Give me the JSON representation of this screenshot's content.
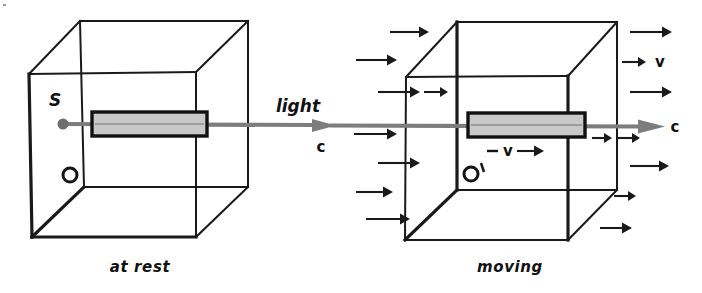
{
  "figure": {
    "type": "physics-diagram"
  },
  "panels": [
    {
      "id": "at-rest",
      "caption": "at rest",
      "caption_pos": {
        "x": 140,
        "y": 272
      },
      "cube": {
        "front_top_left": {
          "x": 29,
          "y": 74
        },
        "front_top_right": {
          "x": 196,
          "y": 72
        },
        "front_bottom_left": {
          "x": 32,
          "y": 237
        },
        "front_bottom_right": {
          "x": 196,
          "y": 237
        },
        "back_top_left": {
          "x": 80,
          "y": 21
        },
        "back_top_right": {
          "x": 248,
          "y": 21
        },
        "back_bottom_left": {
          "x": 84,
          "y": 187
        },
        "back_bottom_right": {
          "x": 248,
          "y": 187
        }
      },
      "labels": [
        {
          "name": "source-label",
          "text": "S",
          "x": 55,
          "y": 106
        },
        {
          "name": "observer-label",
          "text": "O",
          "x": 62,
          "y": 182
        }
      ],
      "observer_circle": {
        "x": 70,
        "y": 175,
        "r": 7
      },
      "source_dot": {
        "x": 63,
        "y": 124,
        "r": 5.5
      },
      "slab": {
        "x": 92,
        "y": 112,
        "width": 115,
        "height": 24
      }
    },
    {
      "id": "moving",
      "caption": "moving",
      "caption_pos": {
        "x": 510,
        "y": 272
      },
      "cube": {
        "front_top_left": {
          "x": 406,
          "y": 77
        },
        "front_top_right": {
          "x": 568,
          "y": 76
        },
        "front_bottom_left": {
          "x": 405,
          "y": 240
        },
        "front_bottom_right": {
          "x": 568,
          "y": 240
        },
        "back_top_left": {
          "x": 457,
          "y": 22
        },
        "back_top_right": {
          "x": 617,
          "y": 22
        },
        "back_bottom_left": {
          "x": 457,
          "y": 190
        },
        "back_bottom_right": {
          "x": 617,
          "y": 190
        }
      },
      "labels": [
        {
          "name": "observer-prime-label",
          "text": "O′",
          "x": 463,
          "y": 182
        },
        {
          "name": "velocity-inner-label",
          "text": "v",
          "x": 508,
          "y": 154
        }
      ],
      "observer_circle": {
        "x": 471,
        "y": 174,
        "r": 7
      },
      "slab": {
        "x": 468,
        "y": 113,
        "width": 117,
        "height": 24
      },
      "inner_velocity_arrow": {
        "dash": {
          "x1": 487,
          "y1": 151,
          "x2": 498,
          "y2": 151
        },
        "arrow": {
          "x1": 517,
          "y1": 151,
          "x2": 538,
          "y2": 151
        }
      }
    }
  ],
  "light_beam": {
    "name": "light-beam",
    "start": {
      "x": 63,
      "y": 124
    },
    "end": {
      "x": 665,
      "y": 126
    },
    "mid_arrow": {
      "x": 320,
      "y": 125
    },
    "labels": [
      {
        "name": "light-label",
        "text": "light",
        "x": 298,
        "y": 110
      },
      {
        "name": "speed-c-left-label",
        "text": "c",
        "x": 320,
        "y": 148
      },
      {
        "name": "speed-c-right-label",
        "text": "c",
        "x": 672,
        "y": 132
      }
    ]
  },
  "aether_wind": {
    "name": "aether-wind-arrows",
    "velocity_label": {
      "name": "velocity-label",
      "text": "v",
      "x": 660,
      "y": 67
    },
    "left_arrows": [
      {
        "x1": 390,
        "y1": 32,
        "x2": 427,
        "y2": 32
      },
      {
        "x1": 356,
        "y1": 60,
        "x2": 396,
        "y2": 60
      },
      {
        "x1": 378,
        "y1": 92,
        "x2": 419,
        "y2": 92
      },
      {
        "x1": 354,
        "y1": 134,
        "x2": 396,
        "y2": 134
      },
      {
        "x1": 378,
        "y1": 163,
        "x2": 419,
        "y2": 163
      },
      {
        "x1": 356,
        "y1": 192,
        "x2": 392,
        "y2": 192
      },
      {
        "x1": 366,
        "y1": 219,
        "x2": 409,
        "y2": 219
      }
    ],
    "right_arrows": [
      {
        "x1": 630,
        "y1": 32,
        "x2": 671,
        "y2": 32
      },
      {
        "x1": 622,
        "y1": 62,
        "x2": 645,
        "y2": 62
      },
      {
        "x1": 630,
        "y1": 92,
        "x2": 671,
        "y2": 92
      },
      {
        "x1": 618,
        "y1": 138,
        "x2": 637,
        "y2": 138
      },
      {
        "x1": 630,
        "y1": 166,
        "x2": 668,
        "y2": 166
      },
      {
        "x1": 618,
        "y1": 196,
        "x2": 630,
        "y2": 196
      },
      {
        "x1": 600,
        "y1": 228,
        "x2": 624,
        "y2": 228
      }
    ],
    "interior_arrows": [
      {
        "x1": 592,
        "y1": 138,
        "x2": 610,
        "y2": 138
      }
    ]
  },
  "colors": {
    "ink": "#1a1a1a",
    "beam": "#7d7d7d",
    "slab_fill": "#c9c9c9",
    "background": "#ffffff"
  }
}
